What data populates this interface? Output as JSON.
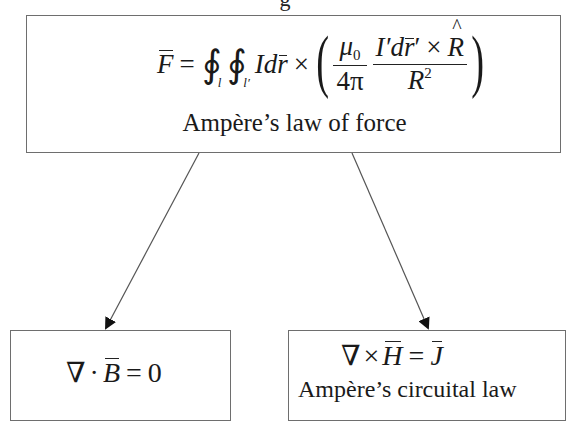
{
  "diagram": {
    "top_box": {
      "equation": {
        "lhs": "F",
        "equals": "=",
        "integral_1_symbol": "∮",
        "integral_1_sub": "l",
        "integral_2_symbol": "∮",
        "integral_2_sub": "l′",
        "current": "I",
        "d": "d",
        "r_vec": "r",
        "cross": "×",
        "paren_open": "(",
        "mu_num": "μ",
        "mu_sub": "0",
        "four_pi": "4π",
        "frac2_num_I": "I′",
        "frac2_num_d": "d",
        "frac2_num_r": "r",
        "frac2_num_prime": "′",
        "frac2_num_cross": "×",
        "frac2_num_R": "R",
        "frac2_den_R": "R",
        "frac2_den_exp": "2",
        "paren_close": ")"
      },
      "caption": "Ampère’s law of force",
      "full_text": "F̄ = ∮_l ∮_l′ I dr̄ × (μ0/4π · I′dr̄′ × R̂ / R²)"
    },
    "bottom_left_box": {
      "equation": {
        "nabla": "∇",
        "dot": "·",
        "B": "B",
        "equals": "=",
        "zero": "0"
      },
      "full_text": "∇·B̄ = 0"
    },
    "bottom_right_box": {
      "equation": {
        "nabla": "∇",
        "cross": "×",
        "H": "H",
        "equals": "=",
        "J": "J"
      },
      "caption": "Ampère’s circuital law",
      "full_text": "∇×H̄ = J̄"
    },
    "arrows": [
      {
        "from": "top_box",
        "to": "bottom_left_box"
      },
      {
        "from": "top_box",
        "to": "bottom_right_box"
      }
    ],
    "clipped_top_text": "g"
  }
}
